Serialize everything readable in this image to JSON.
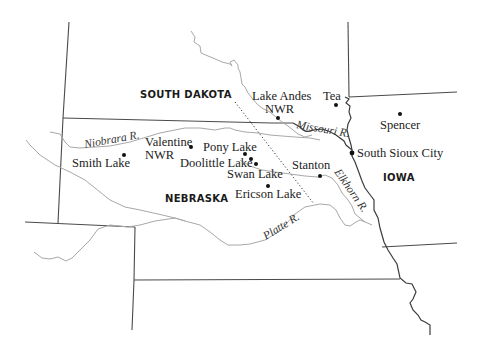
{
  "map": {
    "states": [
      {
        "id": "south-dakota",
        "label": "SOUTH DAKOTA",
        "x": 140,
        "y": 98
      },
      {
        "id": "nebraska",
        "label": "NEBRASKA",
        "x": 165,
        "y": 202
      },
      {
        "id": "iowa",
        "label": "IOWA",
        "x": 383,
        "y": 181
      }
    ],
    "places": [
      {
        "id": "lake-andes-nwr",
        "label_lines": [
          "Lake Andes",
          "NWR"
        ],
        "dot": [
          278,
          118
        ]
      },
      {
        "id": "tea",
        "label_lines": [
          "Tea"
        ],
        "dot": [
          336,
          105
        ]
      },
      {
        "id": "spencer",
        "label_lines": [
          "Spencer"
        ],
        "dot": [
          400,
          114
        ]
      },
      {
        "id": "south-sioux-city",
        "label_lines": [
          "South Sioux City"
        ],
        "dot": [
          352,
          153
        ]
      },
      {
        "id": "smith-lake",
        "label_lines": [
          "Smith Lake"
        ],
        "dot": [
          124,
          155
        ]
      },
      {
        "id": "valentine-nwr",
        "label_lines": [
          "Valentine",
          "NWR"
        ],
        "dot": [
          191,
          146
        ]
      },
      {
        "id": "pony-lake",
        "label_lines": [
          "Pony Lake"
        ],
        "dot": [
          245,
          153
        ]
      },
      {
        "id": "doolittle-lake",
        "label_lines": [
          "Doolittle Lake"
        ],
        "dot": [
          251,
          159
        ]
      },
      {
        "id": "swan-lake",
        "label_lines": [
          "Swan Lake"
        ],
        "dot": [
          256,
          164
        ]
      },
      {
        "id": "stanton",
        "label_lines": [
          "Stanton"
        ],
        "dot": [
          320,
          176
        ]
      },
      {
        "id": "ericson-lake",
        "label_lines": [
          "Ericson Lake"
        ],
        "dot": [
          268,
          186
        ]
      }
    ],
    "rivers": [
      {
        "id": "niobrara",
        "label": "Niobrara R."
      },
      {
        "id": "missouri",
        "label": "Missouri R."
      },
      {
        "id": "elkhorn",
        "label": "Elkhorn R."
      },
      {
        "id": "platte",
        "label": "Platte R."
      }
    ],
    "colors": {
      "state_border": "#4a4a4a",
      "missouri_river": "#3c3c3c",
      "minor_river": "#a8a8a8",
      "text": "#222222"
    }
  }
}
